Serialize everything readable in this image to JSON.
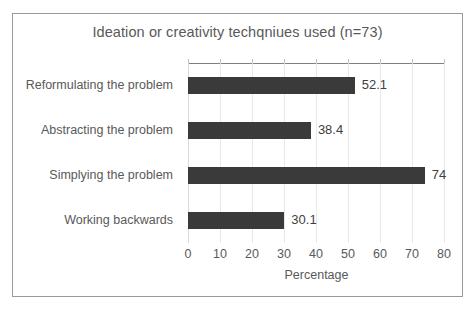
{
  "chart_data": {
    "type": "bar",
    "orientation": "horizontal",
    "title": "Ideation or creativity techqniues used (n=73)",
    "xlabel": "Percentage",
    "ylabel": "",
    "categories": [
      "Reformulating the problem",
      "Abstracting the problem",
      "Simplying the problem",
      "Working backwards"
    ],
    "values": [
      52.1,
      38.4,
      74,
      30.1
    ],
    "value_labels": [
      "52.1",
      "38.4",
      "74",
      "30.1"
    ],
    "xlim": [
      0,
      80
    ],
    "xticks": [
      0,
      10,
      20,
      30,
      40,
      50,
      60,
      70,
      80
    ],
    "xtick_labels": [
      "0",
      "10",
      "20",
      "30",
      "40",
      "50",
      "60",
      "70",
      "80"
    ],
    "grid": "vertical",
    "legend": "none",
    "bar_color": "#3a3a3a",
    "text_color": "#595959",
    "gridline_color": "#e8e8e8",
    "border_color": "#9a9a9a"
  }
}
